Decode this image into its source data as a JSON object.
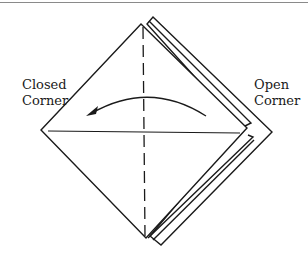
{
  "labels": {
    "closed_line1": "Closed",
    "closed_line2": "Corner",
    "open_line1": "Open",
    "open_line2": "Corner"
  },
  "colors": {
    "stroke": "#1a1a1a",
    "rule": "#8a8a8a",
    "background": "#ffffff"
  }
}
